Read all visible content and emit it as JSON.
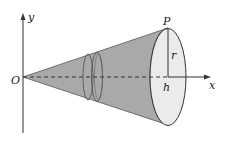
{
  "diagram": {
    "type": "cone-volume-of-revolution",
    "labels": {
      "y_axis": "y",
      "x_axis": "x",
      "origin": "O",
      "point": "P",
      "radius": "r",
      "height": "h"
    },
    "colors": {
      "cone_fill": "#a9a9a9",
      "base_fill": "#ebebeb",
      "stroke": "#333333",
      "background": "#ffffff"
    }
  }
}
